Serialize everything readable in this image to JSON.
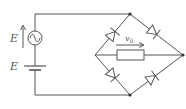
{
  "diagram": {
    "type": "circuit",
    "labels": {
      "ac_source_emf": "E",
      "dc_source_emf": "E",
      "output_voltage": "v",
      "output_voltage_sub": "0"
    },
    "components": [
      {
        "id": "ac_source",
        "kind": "ac-voltage-source",
        "label": "E"
      },
      {
        "id": "battery",
        "kind": "dc-voltage-source",
        "label": "E"
      },
      {
        "id": "d1",
        "kind": "diode",
        "position": "upper-left"
      },
      {
        "id": "d2",
        "kind": "diode",
        "position": "upper-right"
      },
      {
        "id": "d3",
        "kind": "diode",
        "position": "lower-left"
      },
      {
        "id": "d4",
        "kind": "diode",
        "position": "lower-right"
      },
      {
        "id": "r_load",
        "kind": "resistor",
        "label": "v0"
      }
    ],
    "colors": {
      "wire": "#555555",
      "background": "#ffffff"
    }
  }
}
